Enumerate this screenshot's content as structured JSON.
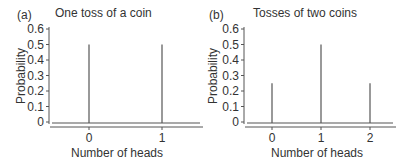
{
  "chart_data": [
    {
      "type": "bar",
      "subtype": "stem",
      "panel_label": "(a)",
      "title": "One toss of a coin",
      "xlabel": "Number of heads",
      "ylabel": "Probability",
      "categories": [
        "0",
        "1"
      ],
      "values": [
        0.5,
        0.5
      ],
      "ylim": [
        0,
        0.6
      ],
      "yticks": [
        "0",
        "0.1",
        "0.2",
        "0.3",
        "0.4",
        "0.5",
        "0.6"
      ],
      "xticks": [
        "0",
        "1"
      ],
      "grid": false,
      "legend": null
    },
    {
      "type": "bar",
      "subtype": "stem",
      "panel_label": "(b)",
      "title": "Tosses of two coins",
      "xlabel": "Number of heads",
      "ylabel": "Probability",
      "categories": [
        "0",
        "1",
        "2"
      ],
      "values": [
        0.25,
        0.5,
        0.25
      ],
      "ylim": [
        0,
        0.6
      ],
      "yticks": [
        "0",
        "0.1",
        "0.2",
        "0.3",
        "0.4",
        "0.5",
        "0.6"
      ],
      "xticks": [
        "0",
        "1",
        "2"
      ],
      "grid": false,
      "legend": null
    }
  ],
  "colors": {
    "line": "#555555",
    "text": "#333333"
  }
}
